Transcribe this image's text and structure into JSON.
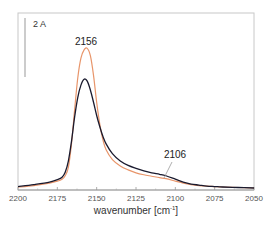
{
  "chart_data": {
    "type": "line",
    "title": "",
    "xlabel": "wavenumber [cm⁻¹]",
    "ylabel": "",
    "xlim": [
      2200,
      2050
    ],
    "x_reversed": true,
    "xticks": [
      2200,
      2175,
      2150,
      2125,
      2100,
      2075,
      2050
    ],
    "grid": false,
    "scale_bar": {
      "label": "2 A"
    },
    "annotations": [
      {
        "text": "2156",
        "x": 2156
      },
      {
        "text": "2106",
        "x": 2106,
        "leader_line": true
      }
    ],
    "series": [
      {
        "name": "orange",
        "color": "#e8956a",
        "x": [
          2200,
          2190,
          2180,
          2175,
          2172,
          2170,
          2168,
          2166,
          2164,
          2162,
          2160,
          2158,
          2156,
          2154,
          2152,
          2150,
          2148,
          2146,
          2144,
          2140,
          2135,
          2130,
          2125,
          2120,
          2115,
          2110,
          2106,
          2100,
          2095,
          2090,
          2085,
          2080,
          2075,
          2070,
          2060,
          2050
        ],
        "y": [
          0.02,
          0.05,
          0.1,
          0.14,
          0.18,
          0.25,
          0.42,
          0.9,
          1.6,
          2.25,
          2.65,
          2.82,
          2.85,
          2.7,
          2.3,
          1.75,
          1.3,
          0.98,
          0.78,
          0.58,
          0.45,
          0.37,
          0.31,
          0.27,
          0.24,
          0.21,
          0.19,
          0.14,
          0.1,
          0.07,
          0.05,
          0.04,
          0.03,
          0.02,
          0.01,
          0.0
        ]
      },
      {
        "name": "black",
        "color": "#1a1a2e",
        "x": [
          2200,
          2190,
          2180,
          2175,
          2172,
          2170,
          2168,
          2166,
          2164,
          2162,
          2160,
          2158,
          2156,
          2154,
          2152,
          2150,
          2148,
          2146,
          2144,
          2140,
          2135,
          2130,
          2125,
          2120,
          2115,
          2110,
          2106,
          2100,
          2095,
          2090,
          2085,
          2080,
          2075,
          2070,
          2060,
          2050
        ],
        "y": [
          0.03,
          0.07,
          0.12,
          0.17,
          0.22,
          0.32,
          0.55,
          0.95,
          1.45,
          1.85,
          2.1,
          2.22,
          2.18,
          2.0,
          1.75,
          1.48,
          1.25,
          1.05,
          0.9,
          0.7,
          0.55,
          0.46,
          0.4,
          0.35,
          0.31,
          0.28,
          0.25,
          0.18,
          0.12,
          0.08,
          0.06,
          0.04,
          0.03,
          0.02,
          0.01,
          0.0
        ]
      }
    ]
  },
  "labels": {
    "scale_bar": "2 A",
    "peak_main": "2156",
    "peak_shoulder": "2106",
    "xlabel_main": "wavenumber [cm",
    "xlabel_sup": "-1",
    "xlabel_close": "]",
    "ticks": [
      "2200",
      "2175",
      "2150",
      "2125",
      "2100",
      "2075",
      "2050"
    ]
  }
}
